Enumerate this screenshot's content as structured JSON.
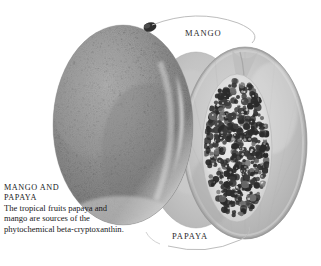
{
  "figure": {
    "type": "photographic-illustration",
    "style": "grayscale halftone",
    "background_color": "#ffffff",
    "subjects": [
      {
        "name": "mango",
        "description": "whole ripe mango, oval, mottled speckled skin with dark stem at upper right",
        "fill_colors": [
          "#a8a8a8",
          "#8d8d8d",
          "#6f6f6f",
          "#cfcfcf"
        ]
      },
      {
        "name": "papaya",
        "description": "papaya cut in half lengthwise showing pale flesh and dense cluster of dark round seeds in central cavity",
        "fill_colors": [
          "#c6c6c6",
          "#b2b2b2",
          "#dcdcdc"
        ],
        "seed_color": "#2a2a2a"
      }
    ]
  },
  "callouts": {
    "mango": {
      "label": "MANGO",
      "leader": "curved arc from mango stem to the right"
    },
    "papaya": {
      "label": "PAPAYA",
      "leader": "curved arc from below the label up to the papaya lower edge"
    }
  },
  "caption": {
    "title_line_1": "MANGO AND",
    "title_line_2": "PAPAYA",
    "body": "The tropical fruits papaya and mango are sources of the phytochemical beta-cryptoxanthin."
  },
  "colors": {
    "text": "#18181a",
    "label_text": "#2b2b2b",
    "leader_line": "#b9b9b9",
    "page_background": "#ffffff"
  }
}
